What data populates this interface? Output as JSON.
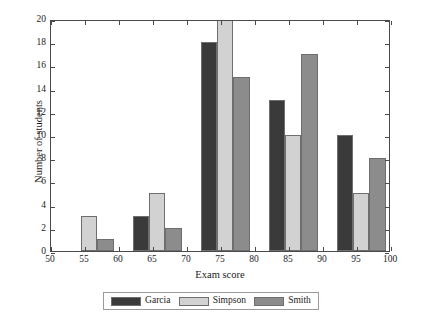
{
  "chart_data": {
    "type": "bar",
    "title": "",
    "subtitle": "",
    "xlabel": "Exam score",
    "ylabel": "Number of students",
    "xlim": [
      50,
      100
    ],
    "ylim": [
      0,
      20
    ],
    "xticks": [
      50,
      55,
      60,
      65,
      70,
      75,
      80,
      85,
      90,
      95,
      100
    ],
    "yticks": [
      0,
      2,
      4,
      6,
      8,
      10,
      12,
      14,
      16,
      18,
      20
    ],
    "xtick_labels": [
      "50",
      "55",
      "60",
      "65",
      "70",
      "75",
      "80",
      "85",
      "90",
      "95",
      "100"
    ],
    "ytick_labels": [
      "0",
      "2",
      "4",
      "6",
      "8",
      "10",
      "12",
      "14",
      "16",
      "18",
      "20"
    ],
    "grid": false,
    "legend_position": "below",
    "bin_starts": [
      50,
      60,
      70,
      80,
      90
    ],
    "categories": [
      "50-60",
      "60-70",
      "70-80",
      "80-90",
      "90-100"
    ],
    "series": [
      {
        "name": "Garcia",
        "color": "#3a3a3a",
        "values": [
          0,
          3,
          18,
          13,
          10
        ]
      },
      {
        "name": "Simpson",
        "color": "#d2d2d2",
        "values": [
          3,
          5,
          20,
          10,
          5
        ]
      },
      {
        "name": "Smith",
        "color": "#8c8c8c",
        "values": [
          1,
          2,
          15,
          17,
          8
        ]
      }
    ]
  },
  "axis": {
    "x_title": "Exam score",
    "y_title": "Number of students"
  },
  "legend": {
    "items": [
      {
        "label": "Garcia",
        "color": "#3a3a3a"
      },
      {
        "label": "Simpson",
        "color": "#d2d2d2"
      },
      {
        "label": "Smith",
        "color": "#8c8c8c"
      }
    ]
  }
}
